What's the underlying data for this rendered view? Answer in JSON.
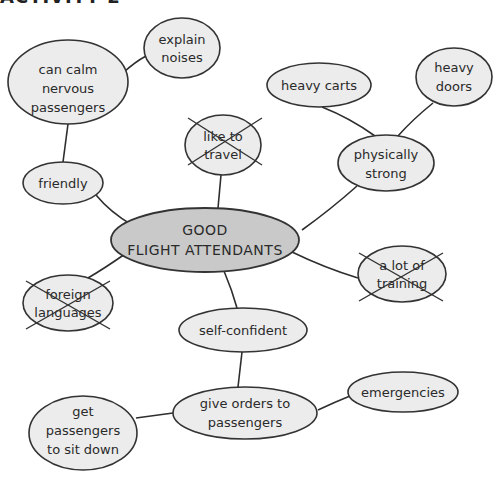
{
  "header": {
    "title": "ACTIVITY 2"
  },
  "center": {
    "line1": "GOOD",
    "line2": "FLIGHT ATTENDANTS"
  },
  "nodes": {
    "explain_noises": {
      "lines": [
        "explain",
        "noises"
      ],
      "crossed_out": false
    },
    "calm_passengers": {
      "lines": [
        "can calm",
        "nervous",
        "passengers"
      ],
      "crossed_out": false
    },
    "heavy_carts": {
      "lines": [
        "heavy carts"
      ],
      "crossed_out": false
    },
    "heavy_doors": {
      "lines": [
        "heavy",
        "doors"
      ],
      "crossed_out": false
    },
    "like_to_travel": {
      "lines": [
        "like to",
        "travel"
      ],
      "crossed_out": true
    },
    "physically_strong": {
      "lines": [
        "physically",
        "strong"
      ],
      "crossed_out": false
    },
    "friendly": {
      "lines": [
        "friendly"
      ],
      "crossed_out": false
    },
    "lot_of_training": {
      "lines": [
        "a lot of",
        "training"
      ],
      "crossed_out": true
    },
    "foreign_languages": {
      "lines": [
        "foreign",
        "languages"
      ],
      "crossed_out": true
    },
    "self_confident": {
      "lines": [
        "self-confident"
      ],
      "crossed_out": false
    },
    "give_orders": {
      "lines": [
        "give orders to",
        "passengers"
      ],
      "crossed_out": false
    },
    "emergencies": {
      "lines": [
        "emergencies"
      ],
      "crossed_out": false
    },
    "sit_down": {
      "lines": [
        "get",
        "passengers",
        "to sit down"
      ],
      "crossed_out": false
    }
  },
  "colors": {
    "bubble_fill": "#ececec",
    "center_fill": "#c9c9c9",
    "stroke": "#333333"
  }
}
